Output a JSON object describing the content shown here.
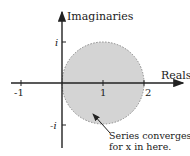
{
  "diagram": {
    "type": "complex-plane-region-of-convergence",
    "axes": {
      "x_label": "Reals",
      "y_label": "Imaginaries",
      "x_ticks": [
        {
          "value": -1,
          "label": "-1"
        },
        {
          "value": 1,
          "label": "1"
        },
        {
          "value": 2,
          "label": "2"
        }
      ],
      "y_ticks": [
        {
          "value": 1,
          "label": "i"
        },
        {
          "value": -1,
          "label": "-i"
        }
      ]
    },
    "region": {
      "shape": "disk",
      "center": [
        1,
        0
      ],
      "radius": 1,
      "fill": "#d4d4d4",
      "border": "dotted"
    },
    "annotation": {
      "line1": "Series converges",
      "line2": "for x in here."
    }
  }
}
